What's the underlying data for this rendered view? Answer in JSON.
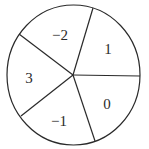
{
  "diagram": {
    "type": "spinner",
    "sections": [
      {
        "label": "−2",
        "position": "top-left"
      },
      {
        "label": "1",
        "position": "top-right"
      },
      {
        "label": "0",
        "position": "bottom-right"
      },
      {
        "label": "−1",
        "position": "bottom"
      },
      {
        "label": "3",
        "position": "left"
      }
    ],
    "colors": {
      "stroke": "#2a2a2a",
      "fill": "#ffffff"
    }
  }
}
